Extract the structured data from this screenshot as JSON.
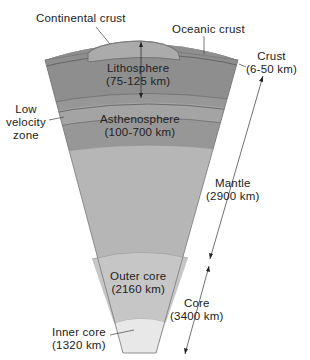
{
  "diagram": {
    "type": "earth-interior-cross-section",
    "labels": {
      "continental_crust": "Continental crust",
      "oceanic_crust": "Oceanic crust",
      "crust_name": "Crust",
      "crust_depth": "(6-50 km)",
      "lithosphere_name": "Lithosphere",
      "lithosphere_depth": "(75-125 km)",
      "low_velocity_1": "Low",
      "low_velocity_2": "velocity",
      "low_velocity_3": "zone",
      "asthenosphere_name": "Asthenosphere",
      "asthenosphere_depth": "(100-700 km)",
      "mantle_name": "Mantle",
      "mantle_depth": "(2900 km)",
      "outer_core_name": "Outer core",
      "outer_core_depth": "(2160 km)",
      "core_name": "Core",
      "core_depth": "(3400 km)",
      "inner_core_name": "Inner core",
      "inner_core_depth": "(1320 km)"
    },
    "colors": {
      "continental_crust": "#a9a9a9",
      "lithosphere": "#8f8f8f",
      "low_velocity_zone": "#a3a3a3",
      "asthenosphere": "#969696",
      "lower_mantle": "#b5b5b5",
      "outer_core": "#c4c4c4",
      "inner_core": "#e6e6e6",
      "outline": "#555555"
    }
  }
}
